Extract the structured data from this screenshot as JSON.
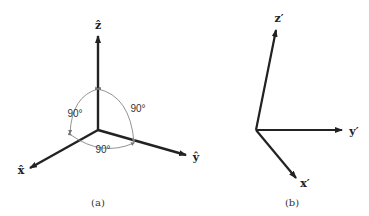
{
  "panels": [
    {
      "id": "a",
      "caption": "(a)",
      "axes": [
        {
          "name": "z",
          "label": "ẑ"
        },
        {
          "name": "y",
          "label": "ŷ"
        },
        {
          "name": "x",
          "label": "x̂"
        }
      ],
      "angles": [
        {
          "between": "x-z",
          "label": "90°"
        },
        {
          "between": "y-z",
          "label": "90°"
        },
        {
          "between": "x-y",
          "label": "90°"
        }
      ]
    },
    {
      "id": "b",
      "caption": "(b)",
      "axes": [
        {
          "name": "z-prime",
          "label": "z′"
        },
        {
          "name": "y-prime",
          "label": "y′"
        },
        {
          "name": "x-prime",
          "label": "x′"
        }
      ]
    }
  ],
  "colors": {
    "axis": "#222222",
    "arc": "#777777"
  }
}
